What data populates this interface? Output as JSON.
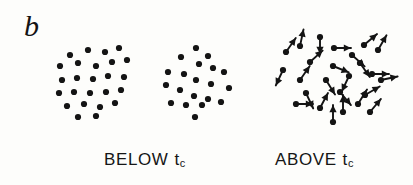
{
  "figure": {
    "panel_label": "b",
    "background_color": "#fdfdfb",
    "ink_color": "#141414",
    "width": 413,
    "height": 185
  },
  "captions": {
    "below": {
      "text": "BELOW",
      "symbol": "t",
      "subscript": "c"
    },
    "above": {
      "text": "ABOVE",
      "symbol": "t",
      "subscript": "c"
    }
  },
  "chart_data": {
    "type": "scatter",
    "title": "b",
    "xlabel": "",
    "ylabel": "",
    "xlim": [
      0,
      413
    ],
    "ylim": [
      0,
      185
    ],
    "grid": false,
    "legend": "none",
    "annotations": [
      "b",
      "BELOW tc",
      "ABOVE tc"
    ],
    "dot_radius": 3.1,
    "arrow_length": 17,
    "series": [
      {
        "name": "cluster-below-left",
        "kind": "dots",
        "cx": 93,
        "cy": 82,
        "points": [
          [
            70,
            55
          ],
          [
            88,
            50
          ],
          [
            105,
            52
          ],
          [
            119,
            48
          ],
          [
            60,
            66
          ],
          [
            78,
            63
          ],
          [
            96,
            66
          ],
          [
            112,
            62
          ],
          [
            127,
            60
          ],
          [
            62,
            80
          ],
          [
            77,
            78
          ],
          [
            93,
            79
          ],
          [
            108,
            76
          ],
          [
            124,
            77
          ],
          [
            59,
            93
          ],
          [
            74,
            92
          ],
          [
            90,
            93
          ],
          [
            106,
            92
          ],
          [
            121,
            90
          ],
          [
            67,
            106
          ],
          [
            84,
            104
          ],
          [
            100,
            107
          ],
          [
            115,
            103
          ],
          [
            78,
            117
          ],
          [
            96,
            116
          ]
        ]
      },
      {
        "name": "cluster-below-right",
        "kind": "dots",
        "cx": 199,
        "cy": 82,
        "points": [
          [
            196,
            48
          ],
          [
            208,
            56
          ],
          [
            181,
            57
          ],
          [
            199,
            64
          ],
          [
            213,
            68
          ],
          [
            168,
            72
          ],
          [
            184,
            74
          ],
          [
            224,
            72
          ],
          [
            196,
            80
          ],
          [
            211,
            84
          ],
          [
            166,
            85
          ],
          [
            180,
            90
          ],
          [
            229,
            88
          ],
          [
            194,
            96
          ],
          [
            208,
            99
          ],
          [
            171,
            103
          ],
          [
            186,
            105
          ],
          [
            202,
            105
          ],
          [
            221,
            102
          ],
          [
            195,
            117
          ]
        ]
      },
      {
        "name": "cluster-above-arrows",
        "kind": "arrows",
        "cx": 330,
        "cy": 85,
        "note": "each entry is [tail_x, tail_y, angle_degrees] with angle measured clockwise from east",
        "points": [
          [
            320,
            37,
            90
          ],
          [
            300,
            46,
            -78
          ],
          [
            334,
            48,
            0
          ],
          [
            286,
            52,
            -55
          ],
          [
            364,
            45,
            -40
          ],
          [
            352,
            55,
            42
          ],
          [
            378,
            50,
            -60
          ],
          [
            310,
            62,
            -42
          ],
          [
            333,
            66,
            22
          ],
          [
            360,
            63,
            55
          ],
          [
            283,
            70,
            115
          ],
          [
            372,
            74,
            0
          ],
          [
            300,
            80,
            -55
          ],
          [
            326,
            80,
            58
          ],
          [
            349,
            76,
            115
          ],
          [
            381,
            80,
            -12
          ],
          [
            306,
            93,
            65
          ],
          [
            340,
            92,
            50
          ],
          [
            365,
            95,
            -30
          ],
          [
            296,
            104,
            0
          ],
          [
            320,
            108,
            -62
          ],
          [
            343,
            112,
            -90
          ],
          [
            358,
            104,
            -58
          ],
          [
            333,
            122,
            -90
          ],
          [
            370,
            112,
            -50
          ]
        ]
      }
    ]
  }
}
